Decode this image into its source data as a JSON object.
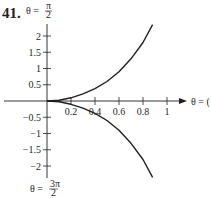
{
  "exercise_number": "41.",
  "chart_data": {
    "type": "line",
    "title": "",
    "coordinate_system": "polar",
    "axes": {
      "vertical_top_label": "θ = π/2",
      "vertical_bottom_label": "θ = 3π/2",
      "horizontal_right_label": "θ = 0"
    },
    "x_ticks": [
      0.2,
      0.4,
      0.6,
      0.8,
      1
    ],
    "x_tick_labels": [
      "0.2",
      "0.4",
      "0.6",
      "0.8",
      "1"
    ],
    "y_ticks": [
      2,
      1.5,
      1,
      0.5,
      -0.5,
      -1,
      -1.5,
      -2
    ],
    "y_tick_labels": [
      "2",
      "1.5",
      "1",
      "0.5",
      "-0.5",
      "-1",
      "-1.5",
      "-2"
    ],
    "xlim": [
      0,
      1.1
    ],
    "ylim": [
      -2.3,
      2.4
    ],
    "grid": false,
    "legend": null,
    "series": [
      {
        "name": "upper branch",
        "points": [
          [
            0.0,
            0.0
          ],
          [
            0.1,
            0.02
          ],
          [
            0.2,
            0.1
          ],
          [
            0.3,
            0.22
          ],
          [
            0.4,
            0.38
          ],
          [
            0.5,
            0.6
          ],
          [
            0.6,
            0.9
          ],
          [
            0.7,
            1.3
          ],
          [
            0.8,
            1.8
          ],
          [
            0.88,
            2.35
          ]
        ]
      },
      {
        "name": "lower branch",
        "points": [
          [
            0.0,
            0.0
          ],
          [
            0.1,
            -0.02
          ],
          [
            0.2,
            -0.1
          ],
          [
            0.3,
            -0.22
          ],
          [
            0.4,
            -0.38
          ],
          [
            0.5,
            -0.6
          ],
          [
            0.6,
            -0.9
          ],
          [
            0.7,
            -1.3
          ],
          [
            0.8,
            -1.8
          ],
          [
            0.88,
            -2.35
          ]
        ]
      }
    ]
  },
  "labels": {
    "top": {
      "theta": "θ =",
      "num": "π",
      "den": "2"
    },
    "bottom": {
      "theta": "θ =",
      "num": "3π",
      "den": "2"
    },
    "right": "θ = ("
  }
}
